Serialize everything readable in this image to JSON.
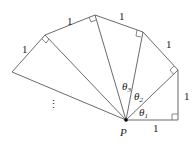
{
  "diagram": {
    "point_label": "P",
    "side_labels": [
      "1",
      "1",
      "1",
      "1",
      "1",
      "1"
    ],
    "angle_labels": [
      "θ1",
      "θ2",
      "θ3"
    ],
    "angle_label_parts": [
      {
        "base": "θ",
        "sub": "1"
      },
      {
        "base": "θ",
        "sub": "2"
      },
      {
        "base": "θ",
        "sub": "3"
      }
    ],
    "continuation": "⋮",
    "colors": {
      "line": "#6a6a6a",
      "text": "#222222",
      "point": "#000000"
    }
  }
}
